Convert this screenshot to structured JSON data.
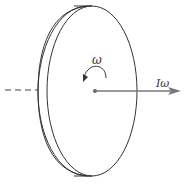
{
  "diagram": {
    "labels": {
      "angular_velocity": "ω",
      "angular_momentum": "Iω"
    },
    "elements": [
      {
        "type": "disc",
        "description": "thin cylindrical disc viewed obliquely"
      },
      {
        "type": "rotation-arrow",
        "label": "ω",
        "direction": "counterclockwise"
      },
      {
        "type": "axis",
        "style": "dashed",
        "side": "left"
      },
      {
        "type": "vector-arrow",
        "label": "Iω",
        "direction": "right",
        "origin": "disc-center"
      }
    ],
    "colors": {
      "stroke": "#333333",
      "arrow": "#777777",
      "background": "#ffffff"
    }
  }
}
